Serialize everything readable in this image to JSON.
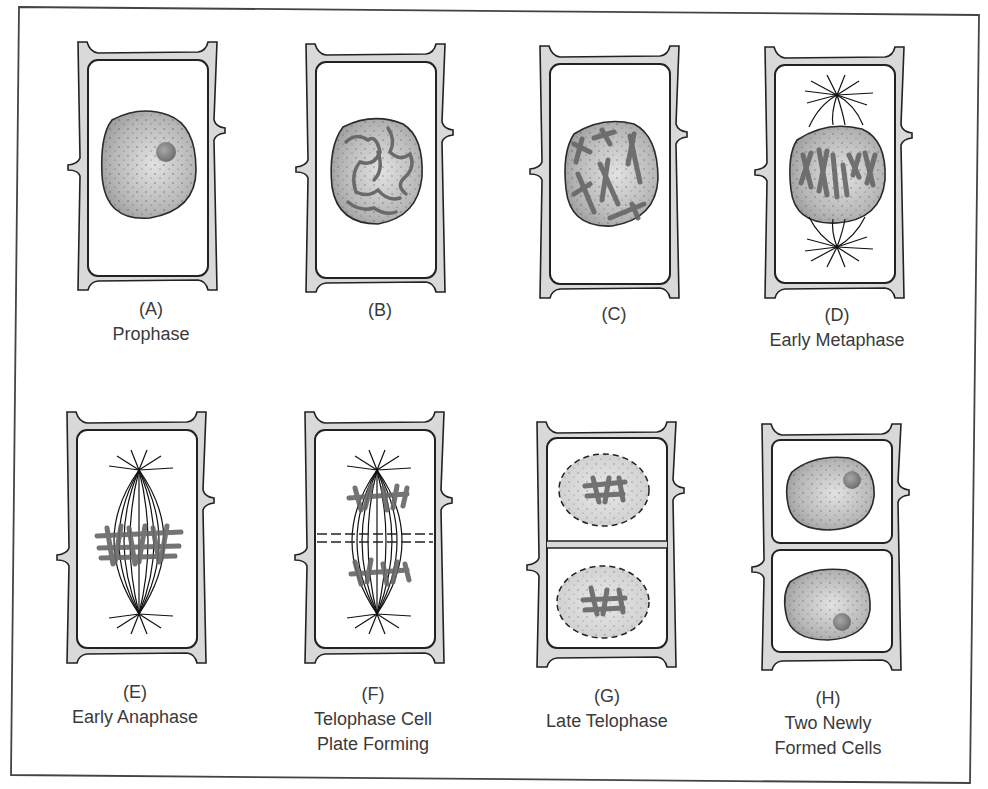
{
  "figure": {
    "colors": {
      "frame": "#444444",
      "cell_wall_fill": "#d9d9d9",
      "outline": "#222222",
      "nucleus_fill": "#b5b5b5",
      "nucleolus_fill": "#8a8a8a",
      "chromosome": "#666666",
      "label_text": "#3a3a3a"
    }
  },
  "panels": [
    {
      "id": "A",
      "letter": "(A)",
      "stage_lines": [
        "Prophase"
      ],
      "content": "interphase-like nucleus with nucleolus"
    },
    {
      "id": "B",
      "letter": "(B)",
      "stage_lines": [],
      "content": "chromatin condensing into threads"
    },
    {
      "id": "C",
      "letter": "(C)",
      "stage_lines": [],
      "content": "condensed X-shaped chromosomes in nucleus"
    },
    {
      "id": "D",
      "letter": "(D)",
      "stage_lines": [
        "Early Metaphase"
      ],
      "content": "spindle poles forming above and below nucleus"
    },
    {
      "id": "E",
      "letter": "(E)",
      "stage_lines": [
        "Early Anaphase"
      ],
      "content": "spindle fibers with chromosomes at equator"
    },
    {
      "id": "F",
      "letter": "(F)",
      "stage_lines": [
        "Telophase Cell",
        "Plate Forming"
      ],
      "content": "chromosomes separated, dashed cell plate"
    },
    {
      "id": "G",
      "letter": "(G)",
      "stage_lines": [
        "Late Telophase"
      ],
      "content": "two daughter nuclei with dashed envelopes, new wall"
    },
    {
      "id": "H",
      "letter": "(H)",
      "stage_lines": [
        "Two Newly",
        "Formed Cells"
      ],
      "content": "two separate cells each with nucleus and nucleolus"
    }
  ]
}
